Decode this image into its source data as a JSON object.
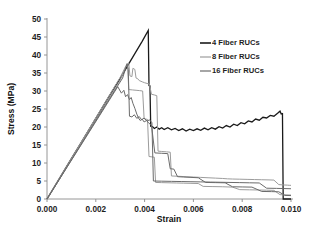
{
  "chart_data": {
    "type": "line",
    "title": "",
    "xlabel": "Strain",
    "ylabel": "Stress (MPa)",
    "xlim": [
      0.0,
      0.01
    ],
    "ylim": [
      0,
      50
    ],
    "xticks": [
      "0.000",
      "0.002",
      "0.004",
      "0.006",
      "0.008",
      "0.010"
    ],
    "xtick_values": [
      0.0,
      0.002,
      0.004,
      0.006,
      0.008,
      0.01
    ],
    "yticks": [
      "0",
      "5",
      "10",
      "15",
      "20",
      "25",
      "30",
      "35",
      "40",
      "45",
      "50"
    ],
    "ytick_values": [
      0,
      5,
      10,
      15,
      20,
      25,
      30,
      35,
      40,
      45,
      50
    ],
    "grid": false,
    "legend_position": "upper right",
    "series": [
      {
        "name": "4 Fiber RUCs",
        "color": "#1a1a1a",
        "width": 1.3,
        "points": [
          [
            0.0,
            0.0
          ],
          [
            0.0005,
            5.6
          ],
          [
            0.001,
            11.2
          ],
          [
            0.0015,
            16.8
          ],
          [
            0.002,
            22.4
          ],
          [
            0.0025,
            28.0
          ],
          [
            0.003,
            33.5
          ],
          [
            0.0033,
            37.0
          ],
          [
            0.0036,
            40.4
          ],
          [
            0.0039,
            43.8
          ],
          [
            0.00415,
            46.8
          ],
          [
            0.00418,
            31.5
          ],
          [
            0.00422,
            31.4
          ],
          [
            0.00425,
            20.2
          ],
          [
            0.00432,
            20.1
          ],
          [
            0.0044,
            19.6
          ],
          [
            0.0045,
            20.0
          ],
          [
            0.0046,
            19.4
          ],
          [
            0.0047,
            19.8
          ],
          [
            0.0048,
            19.3
          ],
          [
            0.00495,
            19.8
          ],
          [
            0.0051,
            19.2
          ],
          [
            0.00525,
            19.6
          ],
          [
            0.0054,
            19.0
          ],
          [
            0.00555,
            19.5
          ],
          [
            0.0057,
            18.9
          ],
          [
            0.00585,
            19.4
          ],
          [
            0.006,
            19.0
          ],
          [
            0.00615,
            19.5
          ],
          [
            0.0063,
            19.1
          ],
          [
            0.00645,
            19.7
          ],
          [
            0.0066,
            19.2
          ],
          [
            0.00675,
            19.8
          ],
          [
            0.0069,
            19.4
          ],
          [
            0.00705,
            20.1
          ],
          [
            0.0072,
            19.7
          ],
          [
            0.00735,
            20.4
          ],
          [
            0.0075,
            20.0
          ],
          [
            0.00765,
            20.8
          ],
          [
            0.0078,
            20.4
          ],
          [
            0.00795,
            21.2
          ],
          [
            0.0081,
            20.9
          ],
          [
            0.00825,
            21.7
          ],
          [
            0.0084,
            21.4
          ],
          [
            0.00855,
            22.2
          ],
          [
            0.0087,
            21.9
          ],
          [
            0.00885,
            22.7
          ],
          [
            0.009,
            22.5
          ],
          [
            0.00915,
            23.2
          ],
          [
            0.0093,
            23.0
          ],
          [
            0.00945,
            23.8
          ],
          [
            0.00955,
            24.4
          ],
          [
            0.0096,
            23.6
          ],
          [
            0.00965,
            23.7
          ],
          [
            0.00968,
            0.0
          ],
          [
            0.01,
            0.0
          ]
        ]
      },
      {
        "name": "8 Fiber RUCs",
        "color": "#9c9c9c",
        "width": 1.0,
        "points": [
          [
            0.0,
            0.0
          ],
          [
            0.0008,
            8.8
          ],
          [
            0.0016,
            17.6
          ],
          [
            0.0024,
            26.4
          ],
          [
            0.003,
            33.0
          ],
          [
            0.00325,
            37.2
          ],
          [
            0.00335,
            37.8
          ],
          [
            0.0034,
            34.2
          ],
          [
            0.00348,
            34.0
          ],
          [
            0.00352,
            36.3
          ],
          [
            0.0036,
            36.0
          ],
          [
            0.00365,
            33.6
          ],
          [
            0.00372,
            33.4
          ],
          [
            0.00378,
            32.9
          ],
          [
            0.00385,
            32.7
          ],
          [
            0.00392,
            32.5
          ],
          [
            0.004,
            32.3
          ],
          [
            0.0041,
            32.1
          ],
          [
            0.0042,
            31.9
          ],
          [
            0.00428,
            29.1
          ],
          [
            0.0044,
            28.9
          ],
          [
            0.0045,
            28.7
          ],
          [
            0.00455,
            13.3
          ],
          [
            0.0047,
            13.2
          ],
          [
            0.0049,
            13.1
          ],
          [
            0.00505,
            13.0
          ],
          [
            0.0051,
            6.4
          ],
          [
            0.0054,
            6.3
          ],
          [
            0.0057,
            6.2
          ],
          [
            0.006,
            6.1
          ],
          [
            0.0063,
            6.0
          ],
          [
            0.0066,
            5.9
          ],
          [
            0.0069,
            5.8
          ],
          [
            0.0072,
            5.7
          ],
          [
            0.0074,
            5.6
          ],
          [
            0.0076,
            5.55
          ],
          [
            0.0079,
            5.5
          ],
          [
            0.0082,
            5.45
          ],
          [
            0.0085,
            5.4
          ],
          [
            0.0088,
            5.35
          ],
          [
            0.0091,
            5.3
          ],
          [
            0.0093,
            5.25
          ],
          [
            0.0095,
            4.0
          ],
          [
            0.0097,
            3.9
          ],
          [
            0.00985,
            3.85
          ],
          [
            0.00995,
            3.8
          ],
          [
            0.01,
            3.8
          ]
        ]
      },
      {
        "name": "8 Fiber RUCs b",
        "color": "#9c9c9c",
        "width": 1.0,
        "points": [
          [
            0.0,
            0.0
          ],
          [
            0.0008,
            9.0
          ],
          [
            0.0016,
            18.0
          ],
          [
            0.0024,
            27.0
          ],
          [
            0.003,
            33.8
          ],
          [
            0.0032,
            36.5
          ],
          [
            0.0033,
            37.4
          ],
          [
            0.00335,
            30.4
          ],
          [
            0.0035,
            30.3
          ],
          [
            0.00365,
            30.2
          ],
          [
            0.0038,
            30.1
          ],
          [
            0.00392,
            30.0
          ],
          [
            0.00398,
            22.3
          ],
          [
            0.00405,
            22.2
          ],
          [
            0.00412,
            22.1
          ],
          [
            0.00418,
            11.8
          ],
          [
            0.0043,
            11.7
          ],
          [
            0.0044,
            11.6
          ],
          [
            0.00445,
            4.6
          ],
          [
            0.0047,
            4.55
          ],
          [
            0.005,
            4.5
          ],
          [
            0.0053,
            4.45
          ],
          [
            0.0056,
            4.4
          ],
          [
            0.0059,
            4.35
          ],
          [
            0.0062,
            4.3
          ],
          [
            0.0064,
            3.5
          ],
          [
            0.0068,
            3.45
          ],
          [
            0.0072,
            3.4
          ],
          [
            0.0076,
            3.3
          ],
          [
            0.0079,
            2.6
          ],
          [
            0.0083,
            2.55
          ],
          [
            0.0087,
            2.5
          ],
          [
            0.009,
            2.45
          ],
          [
            0.0093,
            2.4
          ],
          [
            0.00955,
            1.2
          ],
          [
            0.0098,
            1.15
          ],
          [
            0.01,
            1.1
          ]
        ]
      },
      {
        "name": "16 Fiber RUCs",
        "color": "#6b6b6b",
        "width": 1.0,
        "points": [
          [
            0.0,
            0.0
          ],
          [
            0.0008,
            8.6
          ],
          [
            0.0016,
            17.2
          ],
          [
            0.0024,
            25.8
          ],
          [
            0.0029,
            31.2
          ],
          [
            0.00305,
            29.4
          ],
          [
            0.00315,
            30.2
          ],
          [
            0.00322,
            28.4
          ],
          [
            0.0033,
            29.0
          ],
          [
            0.00338,
            27.6
          ],
          [
            0.00345,
            28.2
          ],
          [
            0.00352,
            26.6
          ],
          [
            0.0036,
            25.2
          ],
          [
            0.00368,
            23.6
          ],
          [
            0.00375,
            22.5
          ],
          [
            0.00382,
            21.8
          ],
          [
            0.0039,
            22.2
          ],
          [
            0.00398,
            21.4
          ],
          [
            0.00408,
            21.8
          ],
          [
            0.00418,
            21.0
          ],
          [
            0.00428,
            20.6
          ],
          [
            0.00438,
            15.0
          ],
          [
            0.00442,
            12.8
          ],
          [
            0.0047,
            12.7
          ],
          [
            0.00495,
            12.6
          ],
          [
            0.00505,
            8.4
          ],
          [
            0.0052,
            8.3
          ],
          [
            0.00535,
            6.2
          ],
          [
            0.0056,
            6.1
          ],
          [
            0.0059,
            6.0
          ],
          [
            0.0062,
            5.9
          ],
          [
            0.0065,
            4.6
          ],
          [
            0.0069,
            4.55
          ],
          [
            0.0073,
            4.5
          ],
          [
            0.0076,
            3.4
          ],
          [
            0.008,
            3.35
          ],
          [
            0.0084,
            3.3
          ],
          [
            0.0088,
            2.1
          ],
          [
            0.0092,
            2.05
          ],
          [
            0.0095,
            2.0
          ],
          [
            0.00975,
            1.0
          ],
          [
            0.01,
            0.95
          ]
        ]
      },
      {
        "name": "16 Fiber RUCs b",
        "color": "#6b6b6b",
        "width": 1.0,
        "points": [
          [
            0.0,
            0.0
          ],
          [
            0.0008,
            8.7
          ],
          [
            0.0016,
            17.4
          ],
          [
            0.0024,
            26.1
          ],
          [
            0.0031,
            33.6
          ],
          [
            0.00328,
            37.6
          ],
          [
            0.00333,
            36.0
          ],
          [
            0.00338,
            23.0
          ],
          [
            0.00348,
            22.8
          ],
          [
            0.00358,
            23.4
          ],
          [
            0.00368,
            22.4
          ],
          [
            0.00378,
            22.9
          ],
          [
            0.00388,
            22.0
          ],
          [
            0.00398,
            22.5
          ],
          [
            0.0041,
            21.6
          ],
          [
            0.0042,
            22.0
          ],
          [
            0.0043,
            21.2
          ],
          [
            0.00436,
            5.0
          ],
          [
            0.0047,
            4.95
          ],
          [
            0.0051,
            4.9
          ],
          [
            0.0055,
            4.85
          ],
          [
            0.0059,
            4.8
          ],
          [
            0.0063,
            4.75
          ],
          [
            0.0067,
            4.7
          ],
          [
            0.0071,
            4.65
          ],
          [
            0.0075,
            4.6
          ],
          [
            0.0079,
            4.55
          ],
          [
            0.0083,
            4.5
          ],
          [
            0.0087,
            4.45
          ],
          [
            0.009,
            3.0
          ],
          [
            0.0094,
            2.95
          ],
          [
            0.0097,
            2.9
          ],
          [
            0.01,
            2.85
          ]
        ]
      }
    ],
    "legend": [
      {
        "label": "4 Fiber RUCs",
        "color": "#1a1a1a",
        "width": 1.6
      },
      {
        "label": "8 Fiber RUCs",
        "color": "#9c9c9c",
        "width": 1.2
      },
      {
        "label": "16 Fiber RUCs",
        "color": "#6b6b6b",
        "width": 1.2
      }
    ]
  }
}
